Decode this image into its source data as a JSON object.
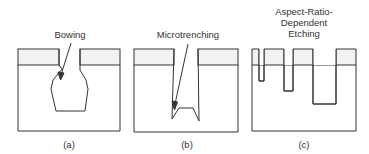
{
  "panels": [
    {
      "title": "Bowing",
      "caption": "(a)"
    },
    {
      "title": "Microtrenching",
      "caption": "(b)"
    },
    {
      "title_lines": [
        "Aspect-Ratio-",
        "Dependent",
        "Etching"
      ],
      "caption": "(c)"
    }
  ],
  "colors": {
    "line": "#333333",
    "mask": "#f2f2f2"
  }
}
